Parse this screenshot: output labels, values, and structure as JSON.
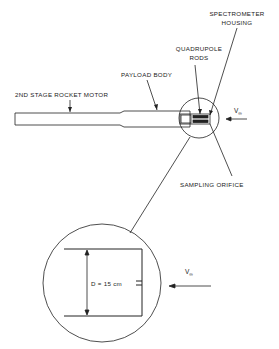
{
  "diagram": {
    "labels": {
      "spectrometer_housing_line1": "SPECTROMETER",
      "spectrometer_housing_line2": "HOUSING",
      "quadrupole_rods_line1": "QUADRUPOLE",
      "quadrupole_rods_line2": "RODS",
      "payload_body": "PAYLOAD BODY",
      "rocket_motor": "2ND STAGE ROCKET MOTOR",
      "sampling_orifice": "SAMPLING ORIFICE",
      "velocity_symbol": "V",
      "velocity_subscript": "∞",
      "diameter_label": "D = 15 cm"
    },
    "colors": {
      "stroke": "#222222",
      "background": "#ffffff"
    }
  }
}
